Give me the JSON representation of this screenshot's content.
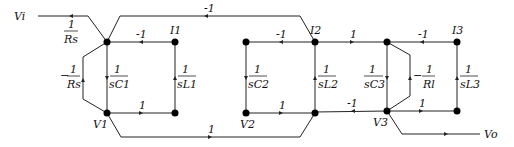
{
  "diagram": {
    "type": "signal-flow-graph",
    "nodes": {
      "Vi": "Vi",
      "V1": "V1",
      "V2": "V2",
      "V3": "V3",
      "I1": "I1",
      "I2": "I2",
      "I3": "I3",
      "Vo": "Vo"
    },
    "gains": {
      "vi_to_node": {
        "sign": "",
        "num": "1",
        "den": "Rs"
      },
      "top_long": "-1",
      "i1_to_node": "-1",
      "i2_to_mid": "-1",
      "i2_to_v3node": "1",
      "i3_to_v3node": "-1",
      "rs_loop": {
        "sign": "−",
        "num": "1",
        "den": "Rs"
      },
      "c1": {
        "sign": "",
        "num": "1",
        "den": "sC1"
      },
      "l1": {
        "sign": "",
        "num": "1",
        "den": "sL1"
      },
      "c2": {
        "sign": "",
        "num": "1",
        "den": "sC2"
      },
      "l2": {
        "sign": "",
        "num": "1",
        "den": "sL2"
      },
      "c3": {
        "sign": "",
        "num": "1",
        "den": "sC3"
      },
      "rl_loop": {
        "sign": "−",
        "num": "1",
        "den": "Rl"
      },
      "l3": {
        "sign": "",
        "num": "1",
        "den": "sL3"
      },
      "v1_to_i1": "1",
      "v2_to_i2": "1",
      "i2bottom_to_v3": "-1",
      "v3_to_i3": "1",
      "bottom_long": "1"
    }
  }
}
